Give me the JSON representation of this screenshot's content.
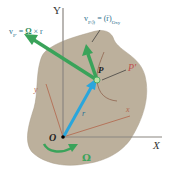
{
  "diagram": {
    "axes": {
      "X_label": "X",
      "Y_label": "Y",
      "x_label": "x",
      "y_label": "y"
    },
    "points": {
      "origin": "O",
      "point_P": "P",
      "point_P_prime": "P'"
    },
    "vectors": {
      "position": "r",
      "omega": "Ω",
      "v_transport": "v_P' = Ω × r",
      "v_transport_parts": {
        "lhs": "v",
        "sub": "P'",
        "eq": " = ",
        "omega": "Ω",
        "rest": " × r"
      },
      "v_relative": "v_P/𝔉 = (ṙ)_Oxy",
      "v_relative_parts": {
        "lhs": "v",
        "sub": "P/𝔉",
        "eq": " = ",
        "rest": "(ṙ)",
        "sub2": "Oxy"
      }
    },
    "colors": {
      "body": "#b9ad99",
      "green_vector": "#3aa35a",
      "blue_vector": "#29a6dc",
      "axis": "#888888",
      "moving_axis": "#b2654a",
      "label_blue": "#2e6f8e"
    }
  }
}
